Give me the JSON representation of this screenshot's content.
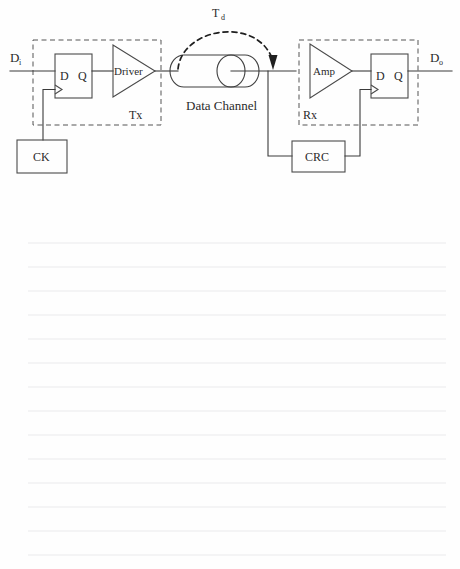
{
  "page": {
    "background_color": "#fefefe",
    "width": 460,
    "height": 569
  },
  "diagram": {
    "title_visible": false,
    "type": "block-diagram",
    "labels": {
      "input_signal": "D",
      "input_signal_sub": "i",
      "output_signal": "D",
      "output_signal_sub": "o",
      "delay": "T",
      "delay_sub": "d",
      "clock_block": "CK",
      "transmitter_group": "Tx",
      "receiver_group": "Rx",
      "driver_block": "Driver",
      "amplifier_block": "Amp",
      "channel_block": "Data Channel",
      "crc_block": "CRC",
      "ff_d_pin": "D",
      "ff_q_pin": "Q"
    },
    "blocks": [
      {
        "name": "tx-flipflop",
        "label_left": "D",
        "label_right": "Q",
        "kind": "d-flip-flop"
      },
      {
        "name": "driver",
        "label": "Driver",
        "kind": "triangle-amplifier"
      },
      {
        "name": "clock-source",
        "label": "CK",
        "kind": "rect"
      },
      {
        "name": "data-channel",
        "label": "Data Channel",
        "kind": "cylinder"
      },
      {
        "name": "amplifier",
        "label": "Amp",
        "kind": "triangle-amplifier"
      },
      {
        "name": "rx-flipflop",
        "label_left": "D",
        "label_right": "Q",
        "kind": "d-flip-flop"
      },
      {
        "name": "crc",
        "label": "CRC",
        "kind": "rect"
      }
    ],
    "groups": [
      {
        "name": "tx-boundary",
        "label": "Tx",
        "style": "dashed"
      },
      {
        "name": "rx-boundary",
        "label": "Rx",
        "style": "dashed"
      }
    ],
    "annotations": [
      {
        "name": "propagation-delay-arc",
        "label": "Td",
        "style": "dashed-arrow"
      }
    ],
    "colors": {
      "ink": "#2b2b2b",
      "wire": "#3a3a3a",
      "dashed": "#555555",
      "rule": "#e9eaec"
    }
  },
  "notes_area": {
    "name": "ruled-note-lines",
    "line_count": 14,
    "line_spacing": 24,
    "first_line_y": 13,
    "left_margin": 28,
    "right_margin": 446,
    "color": "#e9eaec"
  }
}
